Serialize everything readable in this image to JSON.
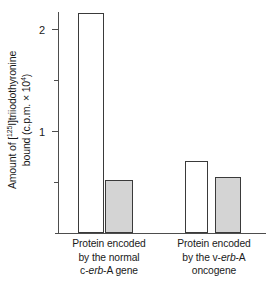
{
  "chart_data": {
    "type": "bar",
    "title": "",
    "xlabel": "",
    "ylabel": "Amount of [125I]triiodothyronine bound (c.p.m. x 10^4)",
    "ylabel_line1_prefix": "Amount of [",
    "ylabel_line1_sup": "125",
    "ylabel_line1_suffix": "I]triiodothyronine",
    "ylabel_line2_prefix": "bound (c.p.m. × 10",
    "ylabel_line2_sup": "4",
    "ylabel_line2_suffix": ")",
    "ylim": [
      0,
      2.3
    ],
    "yticks": [
      0.5,
      1,
      1.5,
      2
    ],
    "ytick_labels": [
      "",
      "1",
      "",
      "2"
    ],
    "grid": false,
    "legend": "none",
    "categories": [
      "Protein encoded by the normal c-erb-A gene",
      "Protein encoded by the v-erb-A oncogene"
    ],
    "category_lines": [
      [
        "Protein encoded",
        "by the normal",
        "c-erb-A gene"
      ],
      [
        "Protein encoded",
        "by the v-erb-A",
        "oncogene"
      ]
    ],
    "series": [
      {
        "name": "open",
        "style": "unfilled",
        "color": "#ffffff",
        "values": [
          2.15,
          0.7
        ]
      },
      {
        "name": "filled",
        "style": "shaded",
        "color": "#d4d4d4",
        "values": [
          0.51,
          0.54
        ]
      }
    ]
  },
  "axis": {
    "tick_label_1": "1",
    "tick_label_2": "2"
  },
  "categories": {
    "group0": {
      "line1": "Protein encoded",
      "line2": "by the normal",
      "line3_pre": "c-",
      "line3_em": "erb",
      "line3_post": "-A gene"
    },
    "group1": {
      "line1": "Protein encoded",
      "line2_pre": "by the v-",
      "line2_em": "erb",
      "line2_post": "-A",
      "line3": "oncogene"
    }
  },
  "colors": {
    "bar_fill_shaded": "#d4d4d4",
    "bar_fill_open": "#ffffff",
    "bar_stroke": "#3a3a3a",
    "axis": "#4d4d4d"
  }
}
